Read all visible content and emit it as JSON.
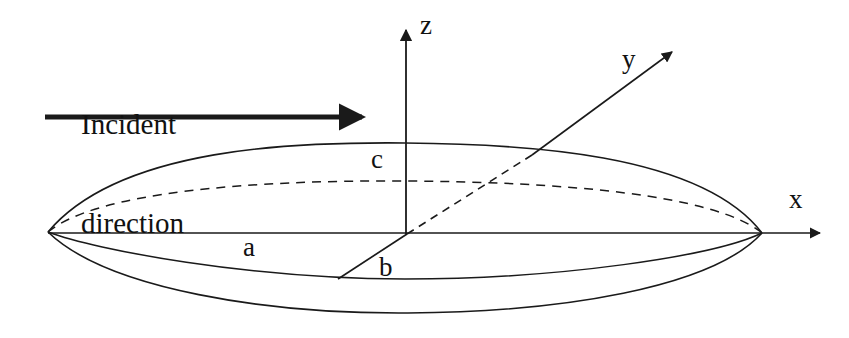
{
  "figure": {
    "kind": "ellipsoid-coordinate-diagram",
    "background_color": "#ffffff",
    "stroke_color": "#1a1a1a",
    "text_color": "#111111"
  },
  "annotations": {
    "incident_line1": "Incident",
    "incident_line2": "direction"
  },
  "axes": {
    "z_label": "z",
    "y_label": "y",
    "x_label": "x"
  },
  "semi_axes": {
    "a_label": "a",
    "b_label": "b",
    "c_label": "c"
  }
}
